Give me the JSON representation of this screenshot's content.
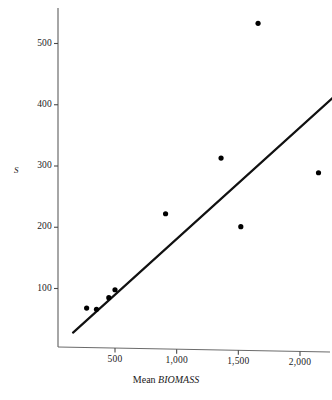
{
  "chart_data": {
    "type": "scatter",
    "title": "",
    "xlabel": "Mean BIOMASS",
    "ylabel": "S",
    "xlabel_plain": "Mean ",
    "xlabel_emphasis": "BIOMASS",
    "xlim": [
      0,
      2300
    ],
    "ylim": [
      0,
      560
    ],
    "grid": false,
    "legend": null,
    "xticks": [
      500,
      1000,
      1500,
      2000
    ],
    "xtick_labels": [
      "500",
      "1,000",
      "1,500",
      "2,000"
    ],
    "yticks": [
      100,
      200,
      300,
      400,
      500
    ],
    "ytick_labels": [
      "100",
      "200",
      "300",
      "400",
      "500"
    ],
    "points": [
      {
        "x": 270,
        "y": 68
      },
      {
        "x": 350,
        "y": 66
      },
      {
        "x": 450,
        "y": 85
      },
      {
        "x": 500,
        "y": 98
      },
      {
        "x": 910,
        "y": 222
      },
      {
        "x": 1360,
        "y": 313
      },
      {
        "x": 1520,
        "y": 201
      },
      {
        "x": 1660,
        "y": 533
      },
      {
        "x": 2150,
        "y": 289
      }
    ],
    "fit_line": {
      "type": "linear-regression",
      "x_start": 160,
      "y_start": 28,
      "x_end": 2270,
      "y_end": 412
    },
    "colors": {
      "point": "#000000",
      "line": "#111111",
      "axis": "#555555",
      "background": "#ffffff"
    }
  }
}
